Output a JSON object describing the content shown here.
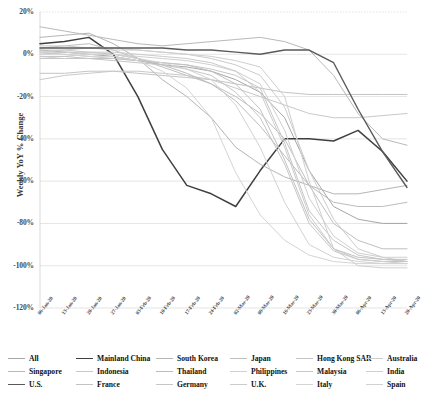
{
  "chart_data": {
    "type": "line",
    "title": "",
    "xlabel": "",
    "ylabel": "Weekly YoY % Change",
    "ylim": [
      -120,
      20
    ],
    "ytick_labels": [
      "20%",
      "0%",
      "-20%",
      "-40%",
      "-60%",
      "-80%",
      "-100%",
      "-120%"
    ],
    "ytick_values": [
      20,
      0,
      -20,
      -40,
      -60,
      -80,
      -100,
      -120
    ],
    "grid": true,
    "legend_position": "bottom",
    "x": [
      "06-Jan-20",
      "13-Jan-20",
      "20-Jan-20",
      "27-Jan-20",
      "03-Feb-20",
      "10-Feb-20",
      "17-Feb-20",
      "24-Feb-20",
      "02-Mar-20",
      "09-Mar-20",
      "16-Mar-20",
      "23-Mar-20",
      "30-Mar-20",
      "06-Apr-20",
      "13-Apr-20",
      "20-Apr-20"
    ],
    "series": [
      {
        "name": "All",
        "color": "#a6a6a6",
        "width": 1.0,
        "values": [
          2,
          1,
          0,
          -1,
          -3,
          -5,
          -6,
          -8,
          -12,
          -18,
          -30,
          -55,
          -72,
          -78,
          -80,
          -80
        ]
      },
      {
        "name": "Mainland China",
        "color": "#3f3f3f",
        "width": 1.5,
        "values": [
          5,
          6,
          8,
          0,
          -20,
          -45,
          -62,
          -66,
          -72,
          -55,
          -40,
          -40,
          -41,
          -36,
          -46,
          -60
        ]
      },
      {
        "name": "South Korea",
        "color": "#b5b5b5",
        "width": 1.0,
        "values": [
          8,
          9,
          10,
          5,
          -2,
          -12,
          -20,
          -30,
          -44,
          -52,
          -58,
          -62,
          -66,
          -66,
          -64,
          -62
        ]
      },
      {
        "name": "Japan",
        "color": "#bfbfbf",
        "width": 1.0,
        "values": [
          3,
          4,
          5,
          2,
          -2,
          -6,
          -10,
          -14,
          -20,
          -28,
          -40,
          -62,
          -80,
          -88,
          -92,
          -92
        ]
      },
      {
        "name": "Hong Kong SAR",
        "color": "#c4c4c4",
        "width": 1.0,
        "values": [
          -9,
          -9,
          -8,
          -8,
          -9,
          -10,
          -11,
          -12,
          -14,
          -16,
          -18,
          -19,
          -19,
          -19,
          -19,
          -19
        ]
      },
      {
        "name": "Australia",
        "color": "#cccccc",
        "width": 1.0,
        "values": [
          1,
          2,
          3,
          3,
          2,
          1,
          0,
          -2,
          -5,
          -10,
          -25,
          -55,
          -78,
          -92,
          -96,
          -98
        ]
      },
      {
        "name": "Singapore",
        "color": "#b9b9b9",
        "width": 1.0,
        "values": [
          13,
          11,
          9,
          7,
          5,
          4,
          5,
          6,
          7,
          8,
          6,
          2,
          -10,
          -28,
          -40,
          -43
        ]
      },
      {
        "name": "Indonesia",
        "color": "#c9c9c9",
        "width": 1.0,
        "values": [
          -12,
          -10,
          -9,
          -8,
          -8,
          -9,
          -10,
          -12,
          -16,
          -20,
          -24,
          -28,
          -30,
          -30,
          -29,
          -28
        ]
      },
      {
        "name": "Thailand",
        "color": "#bcbcbc",
        "width": 1.0,
        "values": [
          0,
          1,
          1,
          0,
          -2,
          -5,
          -9,
          -14,
          -22,
          -34,
          -48,
          -62,
          -70,
          -72,
          -72,
          -70
        ]
      },
      {
        "name": "Philippines",
        "color": "#d0d0d0",
        "width": 1.0,
        "values": [
          -2,
          -1,
          0,
          0,
          -1,
          -2,
          -3,
          -5,
          -8,
          -14,
          -36,
          -68,
          -86,
          -94,
          -96,
          -96
        ]
      },
      {
        "name": "Malaysia",
        "color": "#c7c7c7",
        "width": 1.0,
        "values": [
          1,
          0,
          -1,
          -2,
          -3,
          -4,
          -5,
          -7,
          -10,
          -16,
          -42,
          -74,
          -88,
          -95,
          -97,
          -98
        ]
      },
      {
        "name": "India",
        "color": "#cfcfcf",
        "width": 1.0,
        "values": [
          4,
          4,
          3,
          2,
          2,
          1,
          0,
          -1,
          -3,
          -6,
          -20,
          -60,
          -92,
          -100,
          -101,
          -101
        ]
      },
      {
        "name": "U.S.",
        "color": "#5a5a5a",
        "width": 1.4,
        "values": [
          3,
          3,
          3,
          3,
          3,
          3,
          2,
          2,
          1,
          0,
          2,
          2,
          -4,
          -26,
          -46,
          -63
        ]
      },
      {
        "name": "France",
        "color": "#c2c2c2",
        "width": 1.0,
        "values": [
          -1,
          -1,
          -2,
          -2,
          -3,
          -4,
          -5,
          -8,
          -14,
          -26,
          -50,
          -78,
          -92,
          -96,
          -97,
          -97
        ]
      },
      {
        "name": "Germany",
        "color": "#c6c6c6",
        "width": 1.0,
        "values": [
          -2,
          -2,
          -2,
          -3,
          -4,
          -5,
          -7,
          -10,
          -18,
          -30,
          -52,
          -80,
          -93,
          -97,
          -98,
          -98
        ]
      },
      {
        "name": "U.K.",
        "color": "#cbcbcb",
        "width": 1.0,
        "values": [
          2,
          2,
          1,
          1,
          0,
          -1,
          -2,
          -4,
          -8,
          -18,
          -44,
          -76,
          -92,
          -97,
          -98,
          -99
        ]
      },
      {
        "name": "Italy",
        "color": "#d4d4d4",
        "width": 1.0,
        "values": [
          0,
          0,
          -1,
          -1,
          -3,
          -8,
          -16,
          -30,
          -56,
          -76,
          -88,
          -95,
          -98,
          -99,
          -99,
          -99
        ]
      },
      {
        "name": "Spain",
        "color": "#d2d2d2",
        "width": 1.0,
        "values": [
          1,
          1,
          0,
          0,
          -2,
          -4,
          -7,
          -12,
          -24,
          -44,
          -70,
          -90,
          -96,
          -98,
          -99,
          -99
        ]
      }
    ]
  },
  "legend": {
    "rows": [
      [
        {
          "label": "All",
          "color": "#a6a6a6",
          "width": 1.0
        },
        {
          "label": "Mainland China",
          "color": "#3f3f3f",
          "width": 1.6
        },
        {
          "label": "South Korea",
          "color": "#b5b5b5",
          "width": 1.0
        },
        {
          "label": "Japan",
          "color": "#bfbfbf",
          "width": 1.0
        },
        {
          "label": "Hong Kong SAR",
          "color": "#c4c4c4",
          "width": 1.0
        },
        {
          "label": "Australia",
          "color": "#cccccc",
          "width": 1.0
        }
      ],
      [
        {
          "label": "Singapore",
          "color": "#b9b9b9",
          "width": 1.0
        },
        {
          "label": "Indonesia",
          "color": "#c9c9c9",
          "width": 1.0
        },
        {
          "label": "Thailand",
          "color": "#bcbcbc",
          "width": 1.0
        },
        {
          "label": "Philippines",
          "color": "#d0d0d0",
          "width": 1.0
        },
        {
          "label": "Malaysia",
          "color": "#c7c7c7",
          "width": 1.0
        },
        {
          "label": "India",
          "color": "#cfcfcf",
          "width": 1.0
        }
      ],
      [
        {
          "label": "U.S.",
          "color": "#5a5a5a",
          "width": 1.6
        },
        {
          "label": "France",
          "color": "#c2c2c2",
          "width": 1.0
        },
        {
          "label": "Germany",
          "color": "#c6c6c6",
          "width": 1.0
        },
        {
          "label": "U.K.",
          "color": "#cbcbcb",
          "width": 1.0
        },
        {
          "label": "Italy",
          "color": "#d4d4d4",
          "width": 1.0
        },
        {
          "label": "Spain",
          "color": "#d2d2d2",
          "width": 1.0
        }
      ]
    ]
  },
  "colors": {
    "grid": "#d9d9d9",
    "axis_text": "#4a4a4a",
    "background": "#ffffff"
  }
}
